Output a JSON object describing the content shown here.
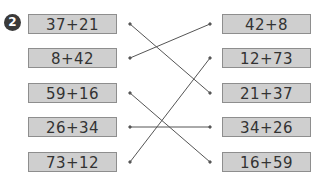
{
  "problem_number": "2",
  "left_expressions": [
    "37+21",
    "8+42",
    "59+16",
    "26+34",
    "73+12"
  ],
  "right_expressions": [
    "42+8",
    "12+73",
    "21+37",
    "34+26",
    "16+59"
  ],
  "matches": [
    {
      "left": "37+21",
      "right": "21+37"
    },
    {
      "left": "8+42",
      "right": "42+8"
    },
    {
      "left": "59+16",
      "right": "16+59"
    },
    {
      "left": "26+34",
      "right": "34+26"
    },
    {
      "left": "73+12",
      "right": "12+73"
    }
  ],
  "colors": {
    "box_fill": "#cfcfcf",
    "box_border": "#8e8e8e",
    "line": "#555555",
    "badge": "#3a3a3a"
  }
}
